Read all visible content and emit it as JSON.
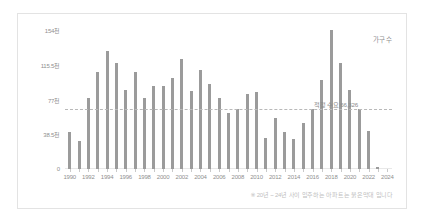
{
  "legend": {
    "series_label": "가구 수"
  },
  "footnote": {
    "text": "※ 20년 ~ 24년 사이 입주하는 아파트는 붉은막대 입니다"
  },
  "reference": {
    "label": "적정 수요 66,326",
    "value": 66326
  },
  "colors": {
    "bar": "#9b9b9b",
    "bar_upcoming": "#9b9b9b",
    "reference_line": "#b9b9b9",
    "axis_text": "#8f8f8f",
    "footnote_text": "#c0c0c0",
    "card_border": "#e3e3e3",
    "background": "#ffffff"
  },
  "chart_data": {
    "type": "bar",
    "title": "",
    "subtitle": "",
    "xlabel": "",
    "ylabel": "가구 수",
    "ylim": [
      0,
      154000
    ],
    "grid": false,
    "legend_position": "top-right",
    "y_tick_labels": [
      "0",
      "38.5천",
      "77천",
      "115.5천",
      "154천"
    ],
    "y_tick_values": [
      0,
      38500,
      77000,
      115500,
      154000
    ],
    "x_tick_labels": [
      "1990",
      "1992",
      "1994",
      "1996",
      "1998",
      "2000",
      "2002",
      "2004",
      "2006",
      "2008",
      "2010",
      "2012",
      "2014",
      "2016",
      "2018",
      "2020",
      "2022",
      "2024"
    ],
    "categories": [
      "1990",
      "1991",
      "1992",
      "1993",
      "1994",
      "1995",
      "1996",
      "1997",
      "1998",
      "1999",
      "2000",
      "2001",
      "2002",
      "2003",
      "2004",
      "2005",
      "2006",
      "2007",
      "2008",
      "2009",
      "2010",
      "2011",
      "2012",
      "2013",
      "2014",
      "2015",
      "2016",
      "2017",
      "2018",
      "2019",
      "2020",
      "2021",
      "2022",
      "2023",
      "2024"
    ],
    "values": [
      41000,
      31000,
      79000,
      108000,
      131000,
      118000,
      87000,
      107000,
      79000,
      92000,
      92000,
      101000,
      122000,
      86000,
      110000,
      94000,
      79000,
      62000,
      66000,
      83000,
      85000,
      34000,
      57000,
      41000,
      33000,
      51000,
      66000,
      99000,
      154000,
      118000,
      88000,
      66000,
      42000,
      2000,
      0
    ],
    "annotations": [
      {
        "text": "적정 수요 66,326",
        "y": 66326,
        "type": "reference-line"
      }
    ],
    "series": [
      {
        "name": "가구 수",
        "color": "#9b9b9b"
      }
    ]
  }
}
